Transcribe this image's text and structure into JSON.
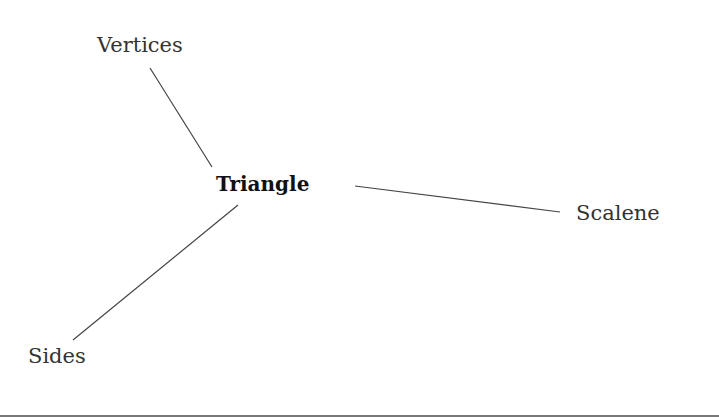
{
  "diagram": {
    "type": "mind-map",
    "center": {
      "label": "Triangle",
      "x": 216,
      "y": 172
    },
    "branches": [
      {
        "label": "Vertices",
        "x": 97,
        "y": 33
      },
      {
        "label": "Scalene",
        "x": 576,
        "y": 201
      },
      {
        "label": "Sides",
        "x": 28,
        "y": 344
      }
    ],
    "line_color": "#444444"
  }
}
